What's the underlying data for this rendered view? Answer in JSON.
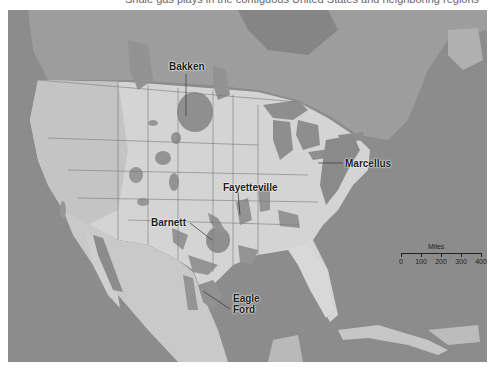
{
  "map": {
    "caption_partial": "Shale gas plays in the contiguous United States and neighboring regions",
    "colors": {
      "ocean": "#8b8b8b",
      "land_us": "#d6d6d6",
      "land_other": "#a3a3a3",
      "shale": "#8f8f8f",
      "label": "#1a1a1a"
    },
    "labels": [
      {
        "name": "Bakken",
        "text": "Bakken"
      },
      {
        "name": "Marcellus",
        "text": "Marcellus"
      },
      {
        "name": "Fayetteville",
        "text": "Fayetteville"
      },
      {
        "name": "Barnett",
        "text": "Barnett"
      },
      {
        "name": "Eagle Ford",
        "text": "Eagle Ford",
        "line1": "Eagle",
        "line2": "Ford"
      }
    ],
    "scale": {
      "title": "Miles",
      "ticks": [
        "0",
        "100",
        "200",
        "300",
        "400"
      ]
    }
  }
}
